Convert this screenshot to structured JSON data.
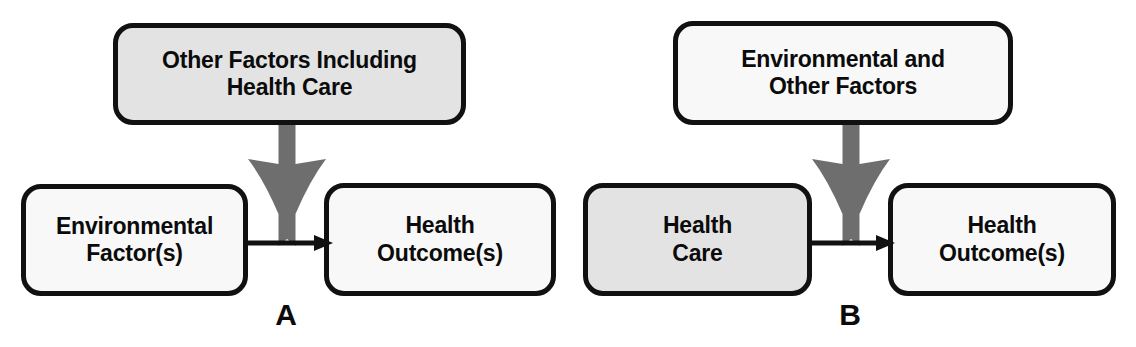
{
  "figure": {
    "background_color": "#ffffff",
    "width": 1136,
    "height": 347
  },
  "style": {
    "box_border_color": "#111111",
    "box_fill_gray": "#e3e3e3",
    "box_fill_white": "#f8f8f8",
    "block_arrow_color": "#6e6e6e",
    "connector_color": "#111111",
    "text_color": "#0b0b0b"
  },
  "panels": [
    {
      "id": "A",
      "letter": "A",
      "nodes": {
        "top": {
          "label": "Other Factors Including\nHealth Care",
          "fill": "gray"
        },
        "left": {
          "label": "Environmental\nFactor(s)",
          "fill": "white"
        },
        "right": {
          "label": "Health\nOutcome(s)",
          "fill": "white"
        }
      },
      "arrows": {
        "block_arrow": {
          "from": "top",
          "to": "connector",
          "direction": "down",
          "color": "#6e6e6e"
        },
        "connector": {
          "from": "left",
          "to": "right",
          "direction": "right",
          "color": "#111111"
        }
      }
    },
    {
      "id": "B",
      "letter": "B",
      "nodes": {
        "top": {
          "label": "Environmental and\nOther Factors",
          "fill": "white"
        },
        "left": {
          "label": "Health\nCare",
          "fill": "gray"
        },
        "right": {
          "label": "Health\nOutcome(s)",
          "fill": "white"
        }
      },
      "arrows": {
        "block_arrow": {
          "from": "top",
          "to": "connector",
          "direction": "down",
          "color": "#6e6e6e"
        },
        "connector": {
          "from": "left",
          "to": "right",
          "direction": "right",
          "color": "#111111"
        }
      }
    }
  ]
}
